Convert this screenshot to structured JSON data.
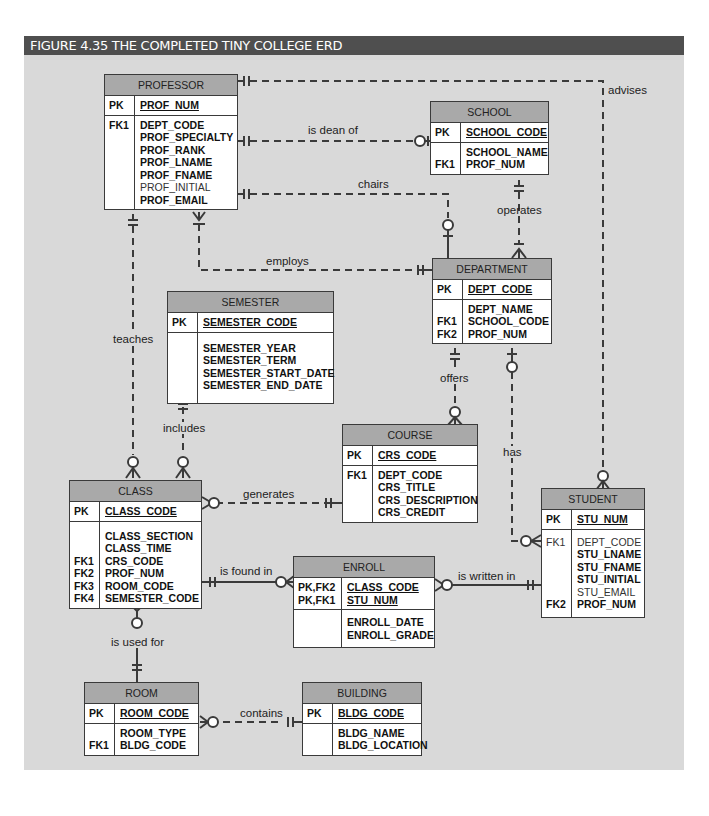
{
  "figure": {
    "title": "FIGURE 4.35  THE COMPLETED TINY COLLEGE ERD"
  },
  "colors": {
    "title_bar": "#4f4f4f",
    "canvas": "#d9d9d9",
    "entity_header": "#a9a9a9",
    "entity_body": "#ffffff",
    "line": "#3a3a3a"
  },
  "entities": {
    "professor": {
      "name": "PROFESSOR",
      "pk_keys": [
        "PK"
      ],
      "pk_attrs": [
        "PROF_NUM"
      ],
      "keys": [
        "FK1",
        "",
        "",
        "",
        "",
        "",
        ""
      ],
      "attrs": [
        "DEPT_CODE",
        "PROF_SPECIALTY",
        "PROF_RANK",
        "PROF_LNAME",
        "PROF_FNAME",
        "PROF_INITIAL",
        "PROF_EMAIL"
      ]
    },
    "school": {
      "name": "SCHOOL",
      "pk_keys": [
        "PK"
      ],
      "pk_attrs": [
        "SCHOOL_CODE"
      ],
      "keys": [
        "",
        "FK1"
      ],
      "attrs": [
        "SCHOOL_NAME",
        "PROF_NUM"
      ]
    },
    "department": {
      "name": "DEPARTMENT",
      "pk_keys": [
        "PK"
      ],
      "pk_attrs": [
        "DEPT_CODE"
      ],
      "keys": [
        "",
        "FK1",
        "FK2"
      ],
      "attrs": [
        "DEPT_NAME",
        "SCHOOL_CODE",
        "PROF_NUM"
      ]
    },
    "semester": {
      "name": "SEMESTER",
      "pk_keys": [
        "PK"
      ],
      "pk_attrs": [
        "SEMESTER_CODE"
      ],
      "keys": [
        "",
        "",
        "",
        ""
      ],
      "attrs": [
        "SEMESTER_YEAR",
        "SEMESTER_TERM",
        "SEMESTER_START_DATE",
        "SEMESTER_END_DATE"
      ]
    },
    "course": {
      "name": "COURSE",
      "pk_keys": [
        "PK"
      ],
      "pk_attrs": [
        "CRS_CODE"
      ],
      "keys": [
        "FK1",
        "",
        "",
        ""
      ],
      "attrs": [
        "DEPT_CODE",
        "CRS_TITLE",
        "CRS_DESCRIPTION",
        "CRS_CREDIT"
      ]
    },
    "class": {
      "name": "CLASS",
      "pk_keys": [
        "PK"
      ],
      "pk_attrs": [
        "CLASS_CODE"
      ],
      "keys": [
        "",
        "",
        "FK1",
        "FK2",
        "FK3",
        "FK4"
      ],
      "attrs": [
        "CLASS_SECTION",
        "CLASS_TIME",
        "CRS_CODE",
        "PROF_NUM",
        "ROOM_CODE",
        "SEMESTER_CODE"
      ]
    },
    "enroll": {
      "name": "ENROLL",
      "pk_keys": [
        "PK,FK2",
        "PK,FK1"
      ],
      "pk_attrs": [
        "CLASS_CODE",
        "STU_NUM"
      ],
      "keys": [
        "",
        ""
      ],
      "attrs": [
        "ENROLL_DATE",
        "ENROLL_GRADE"
      ]
    },
    "student": {
      "name": "STUDENT",
      "pk_keys": [
        "PK"
      ],
      "pk_attrs": [
        "STU_NUM"
      ],
      "keys": [
        "FK1",
        "",
        "",
        "",
        "",
        "FK2"
      ],
      "attrs": [
        "DEPT_CODE",
        "STU_LNAME",
        "STU_FNAME",
        "STU_INITIAL",
        "STU_EMAIL",
        "PROF_NUM"
      ]
    },
    "room": {
      "name": "ROOM",
      "pk_keys": [
        "PK"
      ],
      "pk_attrs": [
        "ROOM_CODE"
      ],
      "keys": [
        "",
        "FK1"
      ],
      "attrs": [
        "ROOM_TYPE",
        "BLDG_CODE"
      ]
    },
    "building": {
      "name": "BUILDING",
      "pk_keys": [
        "PK"
      ],
      "pk_attrs": [
        "BLDG_CODE"
      ],
      "keys": [
        "",
        ""
      ],
      "attrs": [
        "BLDG_NAME",
        "BLDG_LOCATION"
      ]
    }
  },
  "relationships": [
    {
      "label": "advises",
      "from": "PROFESSOR",
      "to": "STUDENT"
    },
    {
      "label": "is dean of",
      "from": "PROFESSOR",
      "to": "SCHOOL"
    },
    {
      "label": "chairs",
      "from": "PROFESSOR",
      "to": "DEPARTMENT"
    },
    {
      "label": "operates",
      "from": "SCHOOL",
      "to": "DEPARTMENT"
    },
    {
      "label": "employs",
      "from": "DEPARTMENT",
      "to": "PROFESSOR"
    },
    {
      "label": "teaches",
      "from": "PROFESSOR",
      "to": "CLASS"
    },
    {
      "label": "offers",
      "from": "DEPARTMENT",
      "to": "COURSE"
    },
    {
      "label": "has",
      "from": "DEPARTMENT",
      "to": "STUDENT"
    },
    {
      "label": "includes",
      "from": "SEMESTER",
      "to": "CLASS"
    },
    {
      "label": "generates",
      "from": "COURSE",
      "to": "CLASS"
    },
    {
      "label": "is found in",
      "from": "CLASS",
      "to": "ENROLL"
    },
    {
      "label": "is written in",
      "from": "STUDENT",
      "to": "ENROLL"
    },
    {
      "label": "is used for",
      "from": "ROOM",
      "to": "CLASS"
    },
    {
      "label": "contains",
      "from": "BUILDING",
      "to": "ROOM"
    }
  ]
}
